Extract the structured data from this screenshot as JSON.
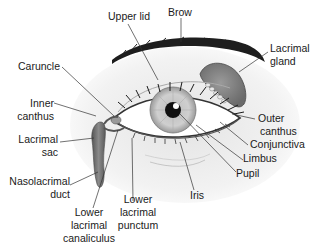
{
  "diagram": {
    "labels": {
      "upper_lid": "Upper lid",
      "brow": "Brow",
      "lacrimal_gland_1": "Lacrimal",
      "lacrimal_gland_2": "gland",
      "caruncle": "Caruncle",
      "inner_canthus_1": "Inner",
      "inner_canthus_2": "canthus",
      "lacrimal_sac_1": "Lacrimal",
      "lacrimal_sac_2": "sac",
      "nasolacrimal_duct_1": "Nasolacrimal",
      "nasolacrimal_duct_2": "duct",
      "lower_lacrimal_canaliculus_1": "Lower",
      "lower_lacrimal_canaliculus_2": "lacrimal",
      "lower_lacrimal_canaliculus_3": "canaliculus",
      "lower_lacrimal_punctum_1": "Lower",
      "lower_lacrimal_punctum_2": "lacrimal",
      "lower_lacrimal_punctum_3": "punctum",
      "iris": "Iris",
      "pupil": "Pupil",
      "limbus": "Limbus",
      "conjunctiva": "Conjunctiva",
      "outer_canthus_1": "Outer",
      "outer_canthus_2": "canthus"
    }
  }
}
